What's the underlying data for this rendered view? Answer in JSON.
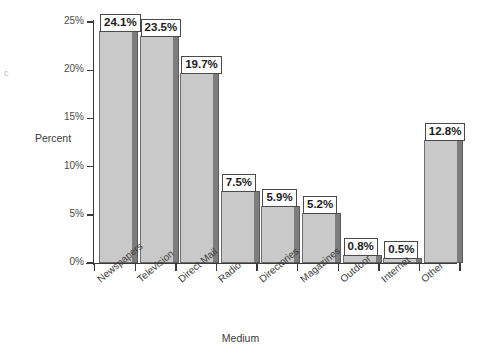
{
  "chart_data": {
    "type": "bar",
    "title": "",
    "subtitle": "",
    "xlabel": "Medium",
    "ylabel": "Percent",
    "categories": [
      "Newspapers",
      "Television",
      "Direct Mail",
      "Radio",
      "Directories",
      "Magazines",
      "Outdoor",
      "Internet",
      "Other"
    ],
    "values": [
      24.1,
      23.5,
      19.7,
      7.5,
      5.9,
      5.2,
      0.8,
      0.5,
      12.8
    ],
    "value_labels": [
      "24.1%",
      "23.5%",
      "19.7%",
      "7.5%",
      "5.9%",
      "5.2%",
      "0.8%",
      "0.5%",
      "12.8%"
    ],
    "ylim": [
      0,
      25
    ],
    "ytick_values": [
      0,
      5,
      10,
      15,
      20,
      25
    ],
    "ytick_labels": [
      "0%",
      "5%",
      "10%",
      "15%",
      "20%",
      "25%"
    ],
    "grid": false,
    "legend": false,
    "legend_position": "none",
    "bar_fill_color": "#c9c9c9",
    "bar_edge_color": "#6d6d6d",
    "bar_shadow_color": "#7d7d7d",
    "axis_color": "#3a3a3a",
    "label_box_fill": "#ffffff",
    "label_box_border": "#4a4a4a",
    "background_color": "#ffffff"
  },
  "artifact": {
    "glyph": "c"
  }
}
